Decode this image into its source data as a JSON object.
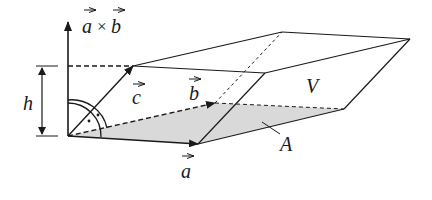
{
  "figure": {
    "labels": {
      "cross_a": "a",
      "cross_op": "×",
      "cross_b": "b",
      "h": "h",
      "c": "c",
      "b": "b",
      "a": "a",
      "V": "V",
      "A": "A"
    },
    "colors": {
      "stroke": "#1a1a1a",
      "base_fill": "#d9d9d9",
      "background": "#ffffff"
    }
  }
}
